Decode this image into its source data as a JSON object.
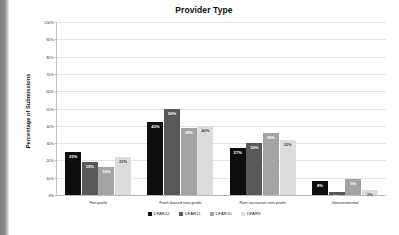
{
  "chart_data": {
    "type": "bar",
    "title": "Provider Type",
    "xlabel": "",
    "ylabel": "Percentage of Submissions",
    "ylim": [
      0,
      100
    ],
    "y_unit": "%",
    "grid": true,
    "legend_position": "bottom",
    "y_ticks": [
      "0%",
      "10%",
      "20%",
      "30%",
      "40%",
      "50%",
      "60%",
      "70%",
      "80%",
      "90%",
      "100%"
    ],
    "y_tick_values": [
      0,
      10,
      20,
      30,
      40,
      50,
      60,
      70,
      80,
      90,
      100
    ],
    "categories": [
      "For-profit",
      "Faith-based non-profit",
      "Non-sectarian non-profit",
      "Governmental"
    ],
    "series": [
      {
        "name": "DFAR12",
        "color": "#0d0d0d",
        "label_color": "#ffffff",
        "values": [
          25,
          42,
          27,
          8
        ]
      },
      {
        "name": "DFAR11",
        "color": "#585858",
        "label_color": "#ffffff",
        "values": [
          19,
          50,
          30,
          2
        ]
      },
      {
        "name": "DFAR10",
        "color": "#a3a3a3",
        "label_color": "#ffffff",
        "values": [
          16,
          39,
          36,
          9
        ]
      },
      {
        "name": "DFAR9",
        "color": "#dcdcdc",
        "label_color": "#4a4a4a",
        "values": [
          22,
          40,
          32,
          3
        ]
      }
    ]
  },
  "colors": {
    "background": "#ffffff",
    "gridline": "#e4e4e4",
    "axis": "#b9b9b9",
    "title_text": "#0d0d0d",
    "scan_edge": "#8c8c8c"
  }
}
